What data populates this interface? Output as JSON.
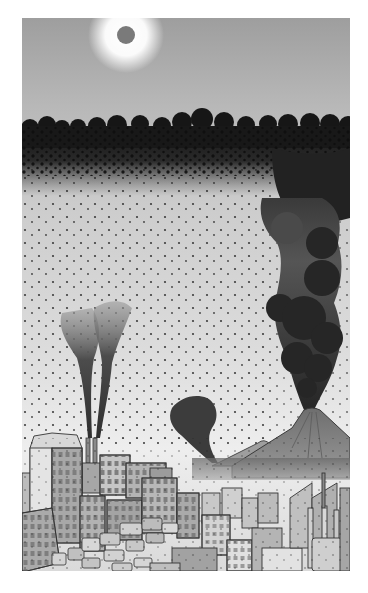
{
  "illustration": {
    "subject": "Grayscale illustration of a polluted industrial city beneath a dark smog layer, with factory smokestacks, an erupting volcano, and traffic-jammed streets",
    "frame": {
      "x": 22,
      "y": 18,
      "width": 328,
      "height": 553
    },
    "palette": {
      "sky_top": "#9c9c9c",
      "sky_mid": "#c4c4c4",
      "haze_low": "#e6e6e6",
      "smog": "#1c1c1c",
      "smoke_dark": "#2a2a2a",
      "sun": "#7a7a7a",
      "sun_glow": "#ffffff",
      "building_light": "#d2d2d2",
      "building_mid": "#a8a8a8",
      "building_dark": "#7c7c7c",
      "outline": "#3a3a3a"
    },
    "elements": {
      "sun": {
        "cx": 104,
        "cy": 17,
        "r": 9,
        "glow_r": 36
      },
      "smog_layer": {
        "top": 95,
        "bottom": 175,
        "label": "smog-cloud-band"
      },
      "factory_smokestacks": {
        "count": 2,
        "x": [
          68,
          75
        ],
        "base_y": 425
      },
      "volcano": {
        "peak_x": 300,
        "peak_y": 392,
        "plume_top_y": 180
      },
      "mid_smoke": {
        "x": 170,
        "y": 385
      },
      "mountain": {
        "peak_x": 255,
        "peak_y": 422
      },
      "city": {
        "skyline_top": 428,
        "street_traffic": true,
        "factory_complex": "right"
      }
    }
  }
}
